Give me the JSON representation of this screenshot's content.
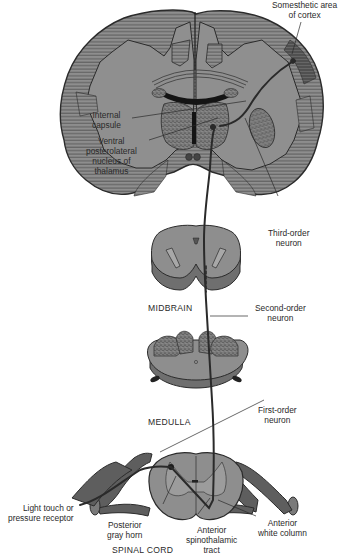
{
  "diagram": {
    "colors": {
      "tissue_gray": "#8c8c8c",
      "tissue_light": "#9a9a9a",
      "hatch_line": "#5a5a5a",
      "outline": "#2b2b2b",
      "neuron_path": "#2a2a2a",
      "ventricle": "#1a1a1a",
      "cortex_dark": "#5f5f5f",
      "background": "#ffffff",
      "label_text": "#2a2a2a"
    },
    "sections": [
      {
        "id": "brain",
        "label": ""
      },
      {
        "id": "midbrain",
        "label": "MIDBRAIN"
      },
      {
        "id": "medulla",
        "label": "MEDULLA"
      },
      {
        "id": "spinal_cord",
        "label": "SPINAL CORD"
      }
    ],
    "labels": {
      "somesthetic": [
        "Somesthetic area",
        "of cortex"
      ],
      "internal_capsule": [
        "Internal",
        "capsule"
      ],
      "vpl_nucleus": [
        "Ventral",
        "posterolateral",
        "nucleus of",
        "thalamus"
      ],
      "third_order": [
        "Third-order",
        "neuron"
      ],
      "second_order": [
        "Second-order",
        "neuron"
      ],
      "first_order": [
        "First-order",
        "neuron"
      ],
      "receptor": [
        "Light touch or",
        "pressure receptor"
      ],
      "posterior_gray_horn": [
        "Posterior",
        "gray horn"
      ],
      "anterior_spinothalamic": [
        "Anterior",
        "spinothalamic",
        "tract"
      ],
      "anterior_white_column": [
        "Anterior",
        "white column"
      ]
    },
    "region_labels": {
      "midbrain": "MIDBRAIN",
      "medulla": "MEDULLA",
      "spinal_cord": "SPINAL CORD"
    }
  }
}
